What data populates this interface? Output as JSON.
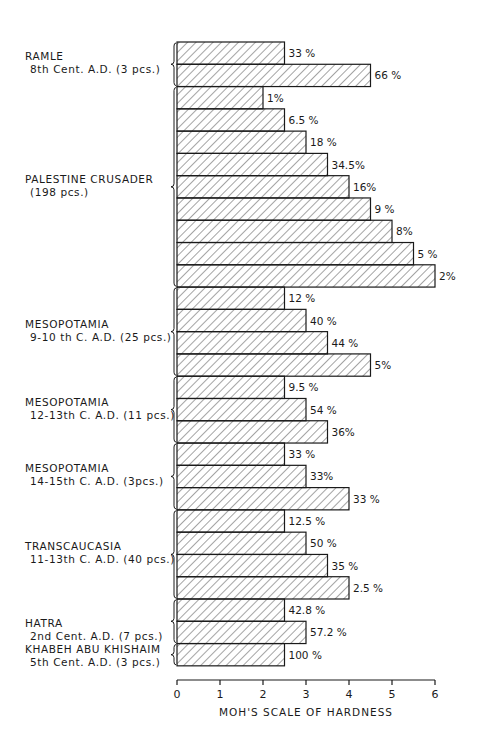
{
  "chart_data": {
    "type": "bar",
    "orientation": "horizontal",
    "title": "",
    "xlabel": "MOH'S SCALE OF HARDNESS",
    "ylabel": "",
    "xlim": [
      0,
      6
    ],
    "xticks": [
      "0",
      "1",
      "2",
      "3",
      "4",
      "5",
      "6"
    ],
    "grid": false,
    "legend": null,
    "fill_pattern": "diagonal-hatch",
    "groups": [
      {
        "label_line1": "RAMLE",
        "label_line2": "8th Cent. A.D. (3 pcs.)",
        "bars": [
          {
            "hardness": 2.5,
            "percent": "33 %"
          },
          {
            "hardness": 4.5,
            "percent": "66 %"
          }
        ]
      },
      {
        "label_line1": "PALESTINE CRUSADER",
        "label_line2": "(198 pcs.)",
        "bars": [
          {
            "hardness": 2.0,
            "percent": "1%"
          },
          {
            "hardness": 2.5,
            "percent": "6.5 %"
          },
          {
            "hardness": 3.0,
            "percent": "18 %"
          },
          {
            "hardness": 3.5,
            "percent": "34.5%"
          },
          {
            "hardness": 4.0,
            "percent": "16%"
          },
          {
            "hardness": 4.5,
            "percent": "9 %"
          },
          {
            "hardness": 5.0,
            "percent": "8%"
          },
          {
            "hardness": 5.5,
            "percent": "5 %"
          },
          {
            "hardness": 6.0,
            "percent": "2%"
          }
        ]
      },
      {
        "label_line1": "MESOPOTAMIA",
        "label_line2": "9-10 th C. A.D. (25 pcs.)",
        "bars": [
          {
            "hardness": 2.5,
            "percent": "12 %"
          },
          {
            "hardness": 3.0,
            "percent": "40 %"
          },
          {
            "hardness": 3.5,
            "percent": "44 %"
          },
          {
            "hardness": 4.5,
            "percent": "5%"
          }
        ]
      },
      {
        "label_line1": "MESOPOTAMIA",
        "label_line2": "12-13th C. A.D. (11 pcs.)",
        "bars": [
          {
            "hardness": 2.5,
            "percent": "9.5 %"
          },
          {
            "hardness": 3.0,
            "percent": "54 %"
          },
          {
            "hardness": 3.5,
            "percent": "36%"
          }
        ]
      },
      {
        "label_line1": "MESOPOTAMIA",
        "label_line2": "14-15th C. A.D. (3pcs.)",
        "bars": [
          {
            "hardness": 2.5,
            "percent": "33 %"
          },
          {
            "hardness": 3.0,
            "percent": "33%"
          },
          {
            "hardness": 4.0,
            "percent": "33 %"
          }
        ]
      },
      {
        "label_line1": "TRANSCAUCASIA",
        "label_line2": "11-13th C. A.D. (40 pcs.)",
        "bars": [
          {
            "hardness": 2.5,
            "percent": "12.5 %"
          },
          {
            "hardness": 3.0,
            "percent": "50 %"
          },
          {
            "hardness": 3.5,
            "percent": "35 %"
          },
          {
            "hardness": 4.0,
            "percent": "2.5 %"
          }
        ]
      },
      {
        "label_line1": "HATRA",
        "label_line2": "2nd Cent. A.D. (7 pcs.)",
        "bars": [
          {
            "hardness": 2.5,
            "percent": "42.8 %"
          },
          {
            "hardness": 3.0,
            "percent": "57.2 %"
          }
        ]
      },
      {
        "label_line1": "KHABEH ABU KHISHAIM",
        "label_line2": "5th Cent. A.D. (3 pcs.)",
        "bars": [
          {
            "hardness": 2.5,
            "percent": "100 %"
          }
        ]
      }
    ]
  },
  "colors": {
    "ink": "#1a1a1a",
    "background": "#ffffff"
  }
}
